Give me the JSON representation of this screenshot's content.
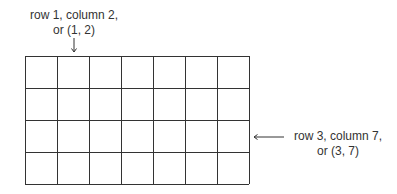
{
  "grid": {
    "rows": 4,
    "columns": 7
  },
  "annotations": {
    "top": {
      "line1": "row 1, column 2,",
      "line2": "or (1, 2)",
      "target": [
        1,
        2
      ]
    },
    "right": {
      "line1": "row 3, column 7,",
      "line2": "or (3, 7)",
      "target": [
        3,
        7
      ]
    }
  },
  "colors": {
    "line": "#333333",
    "text": "#333333"
  }
}
